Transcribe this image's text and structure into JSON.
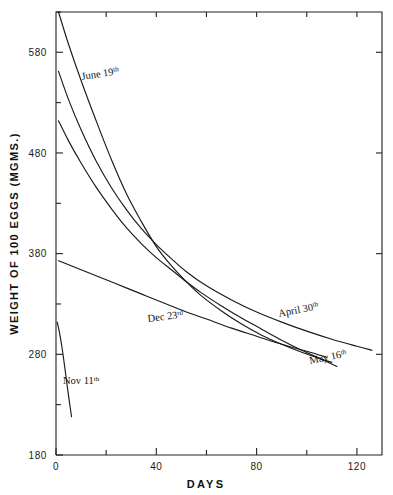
{
  "chart_data": {
    "type": "line",
    "title": "",
    "xlabel": "DAYS",
    "ylabel": "WEIGHT OF 100 EGGS (MGMS.)",
    "xlim": [
      0,
      130
    ],
    "ylim": [
      180,
      620
    ],
    "xticks": [
      0,
      40,
      80,
      120
    ],
    "xticklabels": [
      "0",
      "40",
      "80",
      "120"
    ],
    "xminorticks": [
      20,
      60,
      100
    ],
    "yticks": [
      180,
      280,
      380,
      480,
      580
    ],
    "yticklabels": [
      "180",
      "280",
      "380",
      "480",
      "580"
    ],
    "yminorticks": [
      230,
      330,
      430,
      530,
      620
    ],
    "grid": false,
    "legend_position": "inline-annotations",
    "series": [
      {
        "name": "June 19th",
        "label_base": "June 19",
        "label_sup": "th",
        "points": [
          [
            1,
            620
          ],
          [
            5,
            588
          ],
          [
            10,
            552
          ],
          [
            16,
            512
          ],
          [
            22,
            474
          ],
          [
            28,
            440
          ],
          [
            34,
            412
          ],
          [
            40,
            387
          ],
          [
            46,
            368
          ],
          [
            52,
            352
          ],
          [
            58,
            338
          ],
          [
            66,
            323
          ],
          [
            74,
            310
          ],
          [
            82,
            299
          ],
          [
            90,
            290
          ],
          [
            98,
            282
          ],
          [
            106,
            275
          ],
          [
            110,
            272
          ]
        ]
      },
      {
        "name": "April 30th",
        "label_base": "April 30",
        "label_sup": "th",
        "points": [
          [
            1,
            561
          ],
          [
            5,
            533
          ],
          [
            10,
            503
          ],
          [
            16,
            472
          ],
          [
            22,
            446
          ],
          [
            28,
            424
          ],
          [
            34,
            405
          ],
          [
            40,
            389
          ],
          [
            46,
            375
          ],
          [
            52,
            362
          ],
          [
            60,
            348
          ],
          [
            70,
            334
          ],
          [
            80,
            322
          ],
          [
            90,
            312
          ],
          [
            100,
            303
          ],
          [
            110,
            295
          ],
          [
            120,
            288
          ],
          [
            126,
            284
          ]
        ]
      },
      {
        "name": "May 16th",
        "label_base": "May 16",
        "label_sup": "th",
        "points": [
          [
            1,
            512
          ],
          [
            5,
            492
          ],
          [
            10,
            470
          ],
          [
            16,
            446
          ],
          [
            22,
            425
          ],
          [
            28,
            406
          ],
          [
            34,
            390
          ],
          [
            40,
            376
          ],
          [
            46,
            364
          ],
          [
            52,
            352
          ],
          [
            58,
            341
          ],
          [
            66,
            328
          ],
          [
            74,
            316
          ],
          [
            82,
            305
          ],
          [
            90,
            294
          ],
          [
            98,
            284
          ],
          [
            106,
            275
          ],
          [
            112,
            268
          ]
        ]
      },
      {
        "name": "Dec 23rd",
        "label_base": "Dec 23",
        "label_sup": "rd",
        "points": [
          [
            1,
            373
          ],
          [
            6,
            368
          ],
          [
            12,
            362
          ],
          [
            20,
            354
          ],
          [
            28,
            346
          ],
          [
            36,
            338
          ],
          [
            44,
            330
          ],
          [
            52,
            322
          ],
          [
            60,
            315
          ],
          [
            70,
            306
          ],
          [
            80,
            298
          ],
          [
            90,
            290
          ],
          [
            100,
            283
          ],
          [
            108,
            277
          ]
        ]
      },
      {
        "name": "Nov 11th",
        "label_base": "Nov 11",
        "label_sup": "th",
        "points": [
          [
            0.5,
            312
          ],
          [
            1.5,
            300
          ],
          [
            2.5,
            285
          ],
          [
            3.5,
            267
          ],
          [
            4.5,
            248
          ],
          [
            5.5,
            230
          ],
          [
            6.2,
            218
          ]
        ]
      }
    ],
    "annotations": [
      {
        "name": "June 19th",
        "text_base": "June 19",
        "text_sup": "th",
        "x_px": 82,
        "y_px": 80,
        "rotate": -9
      },
      {
        "name": "Dec 23rd",
        "text_base": "Dec 23",
        "text_sup": "rd",
        "x_px": 148,
        "y_px": 322,
        "rotate": -7
      },
      {
        "name": "April 30th",
        "text_base": "April 30",
        "text_sup": "th",
        "x_px": 279,
        "y_px": 317,
        "rotate": -11
      },
      {
        "name": "May 16th",
        "text_base": "May 16",
        "text_sup": "th",
        "x_px": 310,
        "y_px": 364,
        "rotate": -11
      },
      {
        "name": "Nov 11th",
        "text_base": "Nov 11",
        "text_sup": "th",
        "x_px": 63,
        "y_px": 384,
        "rotate": 0
      }
    ]
  }
}
